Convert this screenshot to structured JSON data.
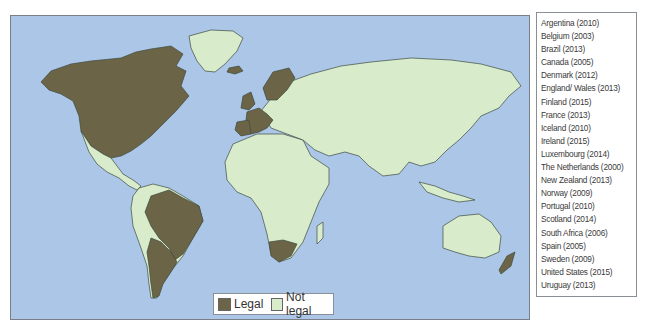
{
  "map": {
    "title": "Same-sex marriage legality world map",
    "colors": {
      "ocean": "#abc6e6",
      "legal": "#6b6447",
      "not_legal": "#d8eccc",
      "border": "#3e4a3e"
    }
  },
  "legend": {
    "items": [
      {
        "label": "Legal",
        "color": "#6b6447"
      },
      {
        "label": "Not legal",
        "color": "#d8eccc"
      }
    ]
  },
  "countries": [
    "Argentina (2010)",
    "Belgium (2003)",
    "Brazil (2013)",
    "Canada (2005)",
    "Denmark (2012)",
    "England/ Wales (2013)",
    "Finland (2015)",
    "France (2013)",
    "Iceland (2010)",
    "Ireland (2015)",
    "Luxembourg (2014)",
    "The Netherlands (2000)",
    "New Zealand (2013)",
    "Norway (2009)",
    "Portugal (2010)",
    "Scotland (2014)",
    "South Africa (2006)",
    "Spain (2005)",
    "Sweden (2009)",
    "United States (2015)",
    "Uruguay (2013)"
  ]
}
